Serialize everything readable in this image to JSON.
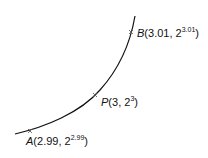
{
  "diagram": {
    "curve": {
      "color": "#111111",
      "function": "2^x"
    },
    "points": [
      {
        "id": "A",
        "name": "A",
        "x_text": "2.99",
        "base": "2",
        "exp": "2.99"
      },
      {
        "id": "P",
        "name": "P",
        "x_text": "3",
        "base": "2",
        "exp": "3"
      },
      {
        "id": "B",
        "name": "B",
        "x_text": "3.01",
        "base": "2",
        "exp": "3.01"
      }
    ]
  }
}
